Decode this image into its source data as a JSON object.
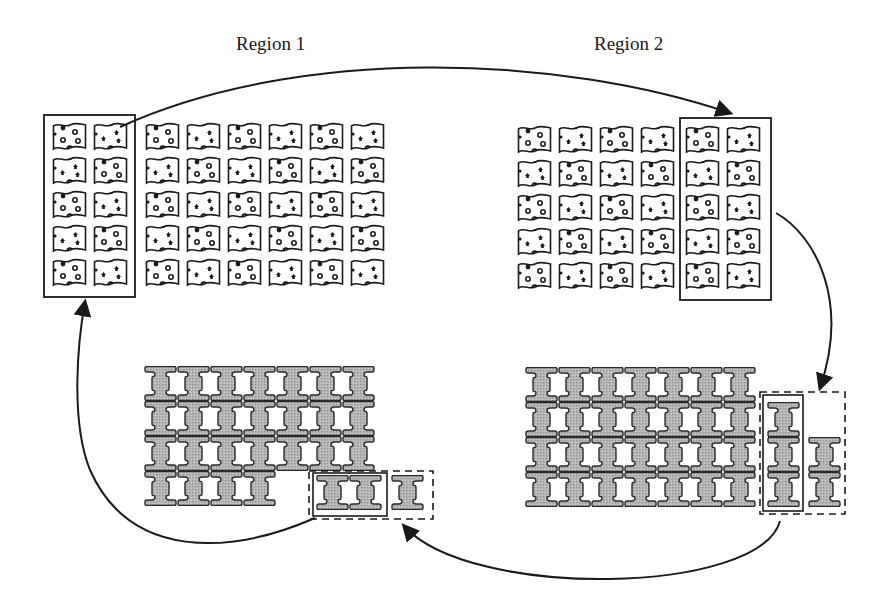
{
  "labels": {
    "region1": "Region 1",
    "region2": "Region 2"
  },
  "colors": {
    "ink": "#1a1a1a",
    "tile_fill": "#ffffff",
    "h_fill": "#a9a9a9",
    "h_stroke": "#2a2a2a"
  },
  "flag_grids": [
    {
      "name": "region1-flag-grid",
      "cols_x": [
        52,
        93,
        145,
        186,
        227,
        268,
        309,
        350
      ],
      "rows_y": [
        122,
        156,
        190,
        224,
        258
      ],
      "highlight_box": {
        "x": 44,
        "y": 115,
        "w": 91,
        "h": 182
      }
    },
    {
      "name": "region2-flag-grid",
      "cols_x": [
        517,
        558,
        599,
        640,
        685,
        726
      ],
      "rows_y": [
        125,
        159,
        193,
        227,
        261
      ],
      "highlight_box": {
        "x": 680,
        "y": 118,
        "w": 91,
        "h": 182
      }
    }
  ],
  "h_grids": [
    {
      "name": "region1-h-grid",
      "origin": {
        "x": 144,
        "y": 366
      },
      "cols": 7,
      "rows": 4,
      "pitch_x": 33,
      "pitch_y": 35,
      "omit": [
        [
          4,
          3
        ],
        [
          5,
          3
        ],
        [
          6,
          3
        ]
      ],
      "extra_tiles": [
        {
          "x": 316,
          "y": 475
        },
        {
          "x": 349,
          "y": 475
        },
        {
          "x": 391,
          "y": 475
        }
      ],
      "solid_box": {
        "x": 313,
        "y": 473,
        "w": 74,
        "h": 43
      },
      "dashed_box": {
        "x": 309,
        "y": 471,
        "w": 124,
        "h": 48
      }
    },
    {
      "name": "region2-h-grid",
      "origin": {
        "x": 525,
        "y": 367
      },
      "cols": 7,
      "rows": 4,
      "pitch_x": 33,
      "pitch_y": 35,
      "omit": [],
      "extra_tiles": [
        {
          "x": 767,
          "y": 402
        },
        {
          "x": 767,
          "y": 437
        },
        {
          "x": 767,
          "y": 472
        },
        {
          "x": 808,
          "y": 437
        },
        {
          "x": 808,
          "y": 472
        }
      ],
      "solid_box": {
        "x": 763,
        "y": 395,
        "w": 40,
        "h": 116
      },
      "dashed_box": {
        "x": 760,
        "y": 392,
        "w": 85,
        "h": 122
      }
    }
  ],
  "arrows": [
    {
      "name": "arrow-region1-to-region2-top",
      "d": "M120,127 C300,45 560,55 730,113"
    },
    {
      "name": "arrow-region2-flags-to-h-strip",
      "d": "M776,213 C815,235 850,300 820,388"
    },
    {
      "name": "arrow-region2-h-strip-to-region1-h",
      "d": "M780,521 C760,595 470,600 404,526"
    },
    {
      "name": "arrow-region1-h-strip-to-region1-flags",
      "d": "M315,518 C230,555 130,560 90,470 C70,420 78,340 85,302"
    }
  ]
}
